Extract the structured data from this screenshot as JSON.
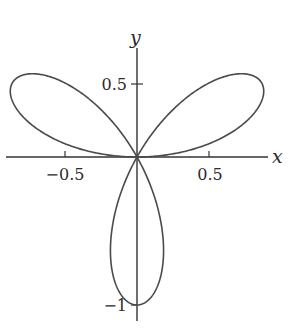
{
  "chart_data": {
    "type": "line",
    "subtype": "polar-parametric",
    "title": "",
    "equation": "r = sin(3θ)",
    "xlabel": "x",
    "ylabel": "y",
    "xlim": [
      -0.9,
      0.9
    ],
    "ylim": [
      -1.1,
      0.75
    ],
    "grid": false,
    "legend": null,
    "x_ticks": [
      {
        "value": -0.5,
        "label": "−0.5"
      },
      {
        "value": 0.5,
        "label": "0.5"
      }
    ],
    "y_ticks": [
      {
        "value": 0.5,
        "label": "0.5"
      },
      {
        "value": -1,
        "label": "−1"
      }
    ],
    "series": [
      {
        "name": "three-petal rose",
        "color": "#4a4a4a",
        "petal_tips": [
          {
            "x": 0.866,
            "y": 0.5
          },
          {
            "x": -0.866,
            "y": 0.5
          },
          {
            "x": 0.0,
            "y": -1.0
          }
        ]
      }
    ]
  },
  "axes": {
    "x_label": "x",
    "y_label": "y",
    "color": "#333333"
  }
}
